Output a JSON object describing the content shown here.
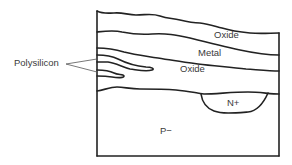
{
  "diagram": {
    "type": "semiconductor-cross-section",
    "colors": {
      "line": "#222222",
      "text": "#3a3a3a",
      "background": "#ffffff"
    },
    "layers": [
      {
        "id": "top-oxide",
        "label": "Oxide"
      },
      {
        "id": "metal",
        "label": "Metal"
      },
      {
        "id": "mid-oxide",
        "label": "Oxide"
      },
      {
        "id": "substrate",
        "label": "P−"
      }
    ],
    "regions": [
      {
        "id": "n-plus-well",
        "label": "N+"
      }
    ],
    "callouts": [
      {
        "id": "polysilicon",
        "label": "Polysilicon",
        "targets": 2
      }
    ]
  }
}
